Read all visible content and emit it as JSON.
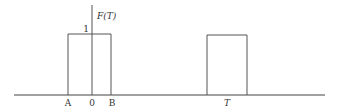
{
  "diagram": {
    "type": "pulse-train",
    "y_axis_label": "F(T)",
    "level_label": "1",
    "x_labels": {
      "a": "A",
      "zero": "0",
      "b": "B",
      "t": "T"
    },
    "pulses": [
      {
        "start": "A",
        "end": "B",
        "height": 1
      },
      {
        "center": "T",
        "height": 1
      }
    ],
    "colors": {
      "stroke": "#555555",
      "axis": "#444444",
      "text": "#333333"
    }
  }
}
